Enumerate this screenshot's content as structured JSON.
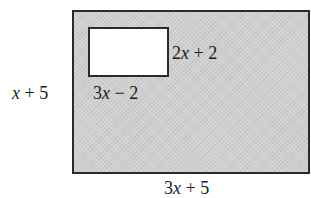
{
  "diagram": {
    "type": "rectangle-with-cutout",
    "outer_rectangle": {
      "width_label": {
        "coef": "3",
        "var": "x",
        "rest": " + 5"
      },
      "height_label": {
        "coef": "",
        "var": "x",
        "rest": " + 5"
      },
      "fill": "#cfcfcf",
      "border": "#2a2a2a"
    },
    "inner_rectangle": {
      "width_label": {
        "coef": "3",
        "var": "x",
        "rest": " − 2"
      },
      "height_label": {
        "coef": "2",
        "var": "x",
        "rest": " + 2"
      },
      "fill": "#ffffff",
      "border": "#2a2a2a"
    }
  }
}
